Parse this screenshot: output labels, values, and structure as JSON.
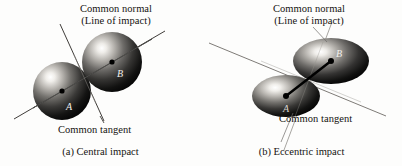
{
  "figure": {
    "type": "diagram",
    "background_color": "#fdfdfc",
    "ink_color": "#15130f",
    "body_fill_dark": "#0b0b0b",
    "body_highlight": "#f4f2ee"
  },
  "panels": [
    {
      "id": "a",
      "caption": "(a) Central impact",
      "normal_label_line1": "Common normal",
      "normal_label_line2": "(Line of impact)",
      "tangent_label": "Common tangent",
      "body_a_letter": "A",
      "body_b_letter": "B",
      "body_shape": "sphere",
      "bodies": [
        {
          "letter": "A",
          "cx": 62,
          "cy": 91,
          "rx": 29,
          "ry": 29
        },
        {
          "letter": "B",
          "cx": 112,
          "cy": 62,
          "rx": 30,
          "ry": 30
        }
      ],
      "line_of_impact": {
        "x1": 14,
        "y1": 119,
        "x2": 165,
        "y2": 31
      },
      "common_tangent": {
        "x1": 60,
        "y1": 24,
        "x2": 104,
        "y2": 121
      },
      "contact_point": {
        "x": 85,
        "y": 76
      }
    },
    {
      "id": "b",
      "caption": "(b) Eccentric impact",
      "normal_label_line1": "Common normal",
      "normal_label_line2": "(Line of impact)",
      "tangent_label": "Common tangent",
      "body_a_letter": "A",
      "body_b_letter": "B",
      "body_shape": "ellipse",
      "bodies": [
        {
          "letter": "A",
          "cx": 85,
          "cy": 96,
          "rx": 34,
          "ry": 21
        },
        {
          "letter": "B",
          "cx": 130,
          "cy": 61,
          "rx": 38,
          "ry": 23
        }
      ],
      "line_of_impact": {
        "x1": 85,
        "y1": 96,
        "x2": 130,
        "y2": 61
      },
      "common_tangent": {
        "x1": 8,
        "y1": 43,
        "x2": 185,
        "y2": 116
      },
      "contact_point": {
        "x": 108,
        "y": 79
      }
    }
  ]
}
